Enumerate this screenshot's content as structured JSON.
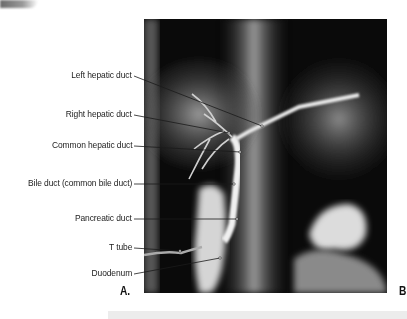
{
  "figure": {
    "panel_labels": {
      "a": "A.",
      "b": "B"
    },
    "image_description": "Radiograph (cholangiogram) of biliary tree with T tube",
    "labels": [
      {
        "id": "left-hepatic-duct",
        "text": "Left hepatic duct"
      },
      {
        "id": "right-hepatic-duct",
        "text": "Right hepatic duct"
      },
      {
        "id": "common-hepatic-duct",
        "text": "Common hepatic duct"
      },
      {
        "id": "bile-duct",
        "text": "Bile duct (common bile duct)"
      },
      {
        "id": "pancreatic-duct",
        "text": "Pancreatic duct"
      },
      {
        "id": "t-tube",
        "text": "T tube"
      },
      {
        "id": "duodenum",
        "text": "Duodenum"
      }
    ]
  },
  "colors": {
    "background": "#ffffff",
    "label_text": "#222222",
    "leader_line": "#1a1a1a",
    "xray_dark": "#0a0a0a",
    "xray_bright": "#e8e8e8"
  }
}
